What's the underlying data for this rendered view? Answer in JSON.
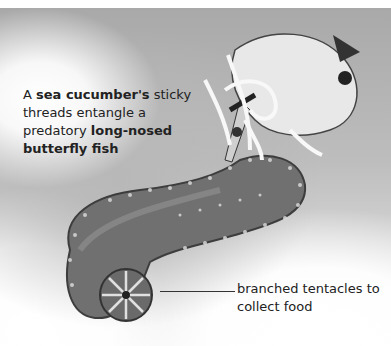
{
  "caption": {
    "part1": "A ",
    "bold1": "sea cucumber's",
    "part2": " sticky threads entangle a predatory ",
    "bold2": "long-nosed butterfly fish"
  },
  "annotation": {
    "label": "branched tentacles to collect food"
  },
  "illustration": {
    "subjects": [
      "sea-cucumber",
      "long-nosed-butterfly-fish"
    ],
    "colors": {
      "background": "#bdbdbd",
      "cucumber_body": "#6e6e6e",
      "fish_body": "#e6e6e6",
      "threads": "#f8f8f8"
    }
  }
}
